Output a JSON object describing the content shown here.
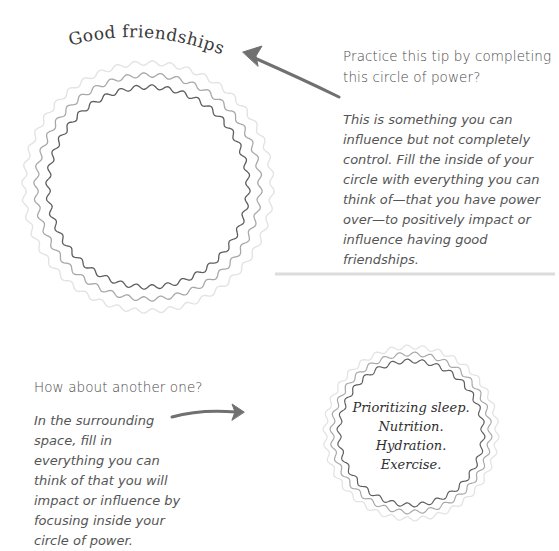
{
  "section1": {
    "circle_title": "Good friendships",
    "prompt": "Practice this tip by completing this circle of power?",
    "instructions": "This is something you can influence but not completely control. Fill the inside of your circle with everything you can think of—that you have power over—to positively impact or influence having good friendships.",
    "arrow_icon": "hand-drawn-arrow-left"
  },
  "divider": "horizontal-rule",
  "section2": {
    "prompt": "How about another one?",
    "instructions": "In the surrounding space, fill in everything you can think of that you will impact or influence by focusing inside your circle of power.",
    "arrow_icon": "hand-drawn-arrow-right",
    "circle_items": [
      "Prioritizing sleep.",
      "Nutrition.",
      "Hydration.",
      "Exercise."
    ]
  },
  "colors": {
    "ring_outer": "#e3e3e3",
    "ring_middle": "#a8a8a8",
    "ring_inner": "#5e5e5e",
    "arrow": "#707070",
    "divider": "#dcdcdc",
    "text": "#4a4a4a"
  }
}
